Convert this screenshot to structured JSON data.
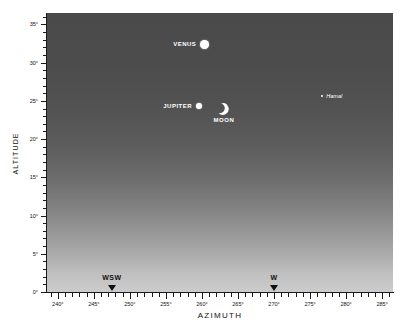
{
  "chart_data": {
    "type": "scatter",
    "title": "",
    "xlabel": "AZIMUTH",
    "ylabel": "ALTITUDE",
    "xlim": [
      238.5,
      286.5
    ],
    "ylim": [
      0,
      36.5
    ],
    "grid": false,
    "legend": "none",
    "background": "twilight gradient, dark at top to light at horizon",
    "x_ticks": [
      "240°",
      "245°",
      "250°",
      "255°",
      "260°",
      "265°",
      "270°",
      "275°",
      "280°",
      "285°"
    ],
    "x_tick_values": [
      240,
      245,
      250,
      255,
      260,
      265,
      270,
      275,
      280,
      285
    ],
    "x_minor_step": 1,
    "y_ticks": [
      "0°",
      "5°",
      "10°",
      "15°",
      "20°",
      "25°",
      "30°",
      "35°"
    ],
    "y_tick_values": [
      0,
      5,
      10,
      15,
      20,
      25,
      30,
      35
    ],
    "y_minor_step": 1,
    "points": [
      {
        "name": "VENUS",
        "azimuth": 260.4,
        "altitude": 32.4,
        "symbol": "disc",
        "size": 9,
        "label_side": "left",
        "color": "#ffffff"
      },
      {
        "name": "JUPITER",
        "azimuth": 259.6,
        "altitude": 24.3,
        "symbol": "disc",
        "size": 6,
        "label_side": "left",
        "color": "#ffffff"
      },
      {
        "name": "MOON",
        "azimuth": 262.9,
        "altitude": 24.0,
        "symbol": "crescent",
        "size": 12,
        "label_side": "below",
        "color": "#ffffff"
      },
      {
        "name": "Hamal",
        "azimuth": 276.7,
        "altitude": 25.6,
        "symbol": "star",
        "size": 2,
        "label_side": "right",
        "color": "#ffffff"
      }
    ],
    "direction_markers": [
      {
        "label": "WSW",
        "azimuth": 247.5
      },
      {
        "label": "W",
        "azimuth": 270.0
      }
    ]
  },
  "caption": ""
}
